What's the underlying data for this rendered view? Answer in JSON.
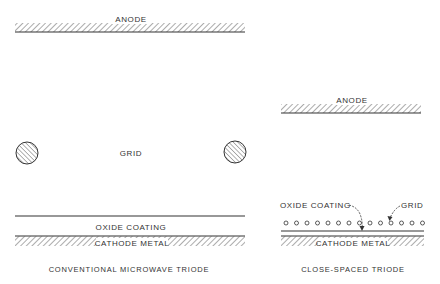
{
  "colors": {
    "ink": "#333333",
    "hatch": "#666666",
    "background": "#ffffff"
  },
  "conventional": {
    "caption": "CONVENTIONAL MICROWAVE TRIODE",
    "anode_label": "ANODE",
    "grid_label": "GRID",
    "oxide_label": "OXIDE COATING",
    "cathode_label": "CATHODE METAL",
    "grid_wire_count": 2
  },
  "close_spaced": {
    "caption": "CLOSE-SPACED TRIODE",
    "anode_label": "ANODE",
    "grid_label": "GRID",
    "oxide_label": "OXIDE COATING",
    "cathode_label": "CATHODE METAL",
    "grid_wire_count": 14
  }
}
